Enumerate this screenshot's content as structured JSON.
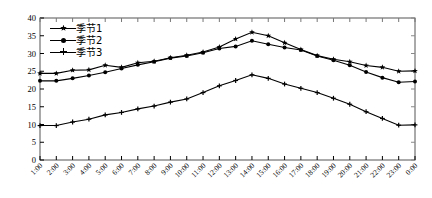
{
  "chart_data": {
    "type": "line",
    "title": "",
    "xlabel": "",
    "ylabel": "",
    "ylim": [
      0,
      40
    ],
    "ytick_step": 5,
    "yticks": [
      0,
      5,
      10,
      15,
      20,
      25,
      30,
      35,
      40
    ],
    "grid": false,
    "legend_position": "upper-left",
    "marker_style": [
      "star",
      "dot",
      "plus"
    ],
    "line_color": "#000000",
    "categories": [
      "1:00",
      "2:00",
      "3:00",
      "4:00",
      "5:00",
      "6:00",
      "7:00",
      "8:00",
      "9:00",
      "10:00",
      "11:00",
      "12:00",
      "13:00",
      "14:00",
      "15:00",
      "16:00",
      "17:00",
      "18:00",
      "19:00",
      "20:00",
      "21:00",
      "22:00",
      "23:00",
      "0:00"
    ],
    "series": [
      {
        "name": "季节1",
        "marker": "star",
        "values": [
          24.4,
          24.4,
          25.3,
          25.4,
          26.7,
          26.1,
          27.4,
          27.8,
          28.8,
          29.5,
          30.4,
          31.8,
          34.1,
          36.0,
          35.0,
          33.0,
          31.1,
          29.4,
          28.4,
          27.7,
          26.6,
          26.1,
          25.0,
          25.1
        ]
      },
      {
        "name": "季节2",
        "marker": "dot",
        "values": [
          22.3,
          22.3,
          23.0,
          23.8,
          24.7,
          25.8,
          26.8,
          27.7,
          28.7,
          29.3,
          30.2,
          31.4,
          32.0,
          33.6,
          32.6,
          31.7,
          31.0,
          29.3,
          28.1,
          26.7,
          24.8,
          23.2,
          21.9,
          22.1
        ]
      },
      {
        "name": "季节3",
        "marker": "plus",
        "values": [
          9.7,
          9.7,
          10.7,
          11.5,
          12.7,
          13.4,
          14.4,
          15.2,
          16.3,
          17.2,
          19.0,
          20.9,
          22.4,
          24.0,
          23.0,
          21.4,
          20.2,
          19.0,
          17.4,
          15.7,
          13.6,
          11.7,
          9.8,
          9.9
        ]
      }
    ]
  },
  "axes": {
    "y_tick_labels": [
      "0",
      "5",
      "10",
      "15",
      "20",
      "25",
      "30",
      "35",
      "40"
    ],
    "x_tick_labels": [
      "1:00",
      "2:00",
      "3:00",
      "4:00",
      "5:00",
      "6:00",
      "7:00",
      "8:00",
      "9:00",
      "10:00",
      "11:00",
      "12:00",
      "13:00",
      "14:00",
      "15:00",
      "16:00",
      "17:00",
      "18:00",
      "19:00",
      "20:00",
      "21:00",
      "22:00",
      "23:00",
      "0:00"
    ]
  },
  "legend": {
    "entries": [
      {
        "label": "季节1"
      },
      {
        "label": "季节2"
      },
      {
        "label": "季节3"
      }
    ]
  }
}
